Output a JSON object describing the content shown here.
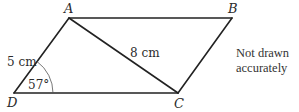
{
  "diagram": {
    "type": "parallelogram",
    "vertices": {
      "A": {
        "label": "A",
        "x": 69,
        "y": 18
      },
      "B": {
        "label": "B",
        "x": 232,
        "y": 18
      },
      "C": {
        "label": "C",
        "x": 178,
        "y": 93
      },
      "D": {
        "label": "D",
        "x": 14,
        "y": 93
      }
    },
    "edges": [
      "AB",
      "BC",
      "CD",
      "DA",
      "AC"
    ],
    "measurements": {
      "AD": "5 cm",
      "AC": "8 cm",
      "angle_D": "57°"
    },
    "note_line1": "Not drawn",
    "note_line2": "accurately"
  }
}
